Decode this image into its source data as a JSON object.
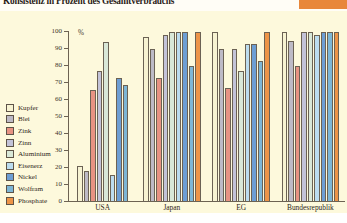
{
  "title": "Konsistenz in Prozent des Gesamtverbrauchs",
  "axis": {
    "unit": "%",
    "y_ticks": [
      "100",
      "90",
      "80",
      "70",
      "60",
      "50",
      "40",
      "30",
      "20",
      "10",
      "0"
    ]
  },
  "legend": {
    "items": [
      {
        "label": "Kupfer",
        "color": "#f7f3d2"
      },
      {
        "label": "Blei",
        "color": "#bdbac6"
      },
      {
        "label": "Zink",
        "color": "#e79383"
      },
      {
        "label": "Zinn",
        "color": "#c3c3d8"
      },
      {
        "label": "Aluminium",
        "color": "#d9e8d8"
      },
      {
        "label": "Eisenerz",
        "color": "#bcdcef"
      },
      {
        "label": "Nickel",
        "color": "#6d9ed4"
      },
      {
        "label": "Wolfram",
        "color": "#7db6d6"
      },
      {
        "label": "Phosphate",
        "color": "#ed9448"
      }
    ]
  },
  "groups": [
    {
      "label": "USA",
      "label2": ""
    },
    {
      "label": "Japan",
      "label2": ""
    },
    {
      "label": "EG",
      "label2": ""
    },
    {
      "label": "Bundesrepublik",
      "label2": "Deutschland"
    }
  ],
  "chart_data": {
    "type": "bar",
    "title": "Konsistenz in Prozent des Gesamtverbrauchs",
    "xlabel": "",
    "ylabel": "%",
    "ylim": [
      0,
      100
    ],
    "grid": false,
    "legend_position": "left",
    "categories": [
      "USA",
      "Japan",
      "EG",
      "Bundesrepublik Deutschland"
    ],
    "series": [
      {
        "name": "Kupfer",
        "color": "#f7f3d2",
        "values": [
          21,
          97,
          100,
          100
        ]
      },
      {
        "name": "Blei",
        "color": "#bdbac6",
        "values": [
          18,
          90,
          90,
          95
        ]
      },
      {
        "name": "Zink",
        "color": "#e79383",
        "values": [
          66,
          73,
          67,
          80
        ]
      },
      {
        "name": "Zinn",
        "color": "#c3c3d8",
        "values": [
          77,
          98,
          90,
          100
        ]
      },
      {
        "name": "Aluminium",
        "color": "#d9e8d8",
        "values": [
          94,
          100,
          77,
          100
        ]
      },
      {
        "name": "Eisenerz",
        "color": "#bcdcef",
        "values": [
          16,
          100,
          93,
          98
        ]
      },
      {
        "name": "Nickel",
        "color": "#6d9ed4",
        "values": [
          73,
          100,
          93,
          100
        ]
      },
      {
        "name": "Wolfram",
        "color": "#7db6d6",
        "values": [
          69,
          80,
          83,
          100
        ]
      },
      {
        "name": "Phosphate",
        "color": "#ed9448",
        "values": [
          null,
          100,
          100,
          100
        ]
      }
    ]
  }
}
